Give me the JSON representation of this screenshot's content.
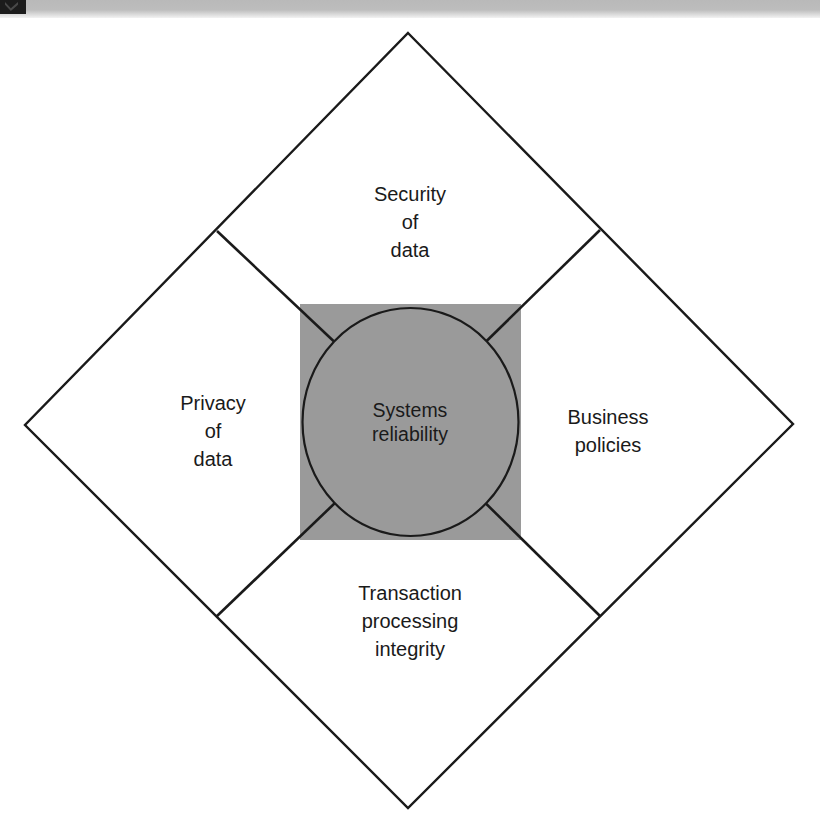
{
  "figure": {
    "center": {
      "line1": "Systems",
      "line2": "reliability"
    },
    "quadrants": {
      "top": {
        "line1": "Security",
        "line2": "of",
        "line3": "data"
      },
      "left": {
        "line1": "Privacy",
        "line2": "of",
        "line3": "data"
      },
      "right": {
        "line1": "Business",
        "line2": "policies",
        "line3": ""
      },
      "bottom": {
        "line1": "Transaction",
        "line2": "processing",
        "line3": "integrity"
      }
    },
    "colors": {
      "stroke": "#1a1a1a",
      "center_fill": "#9a9a9a",
      "background": "#ffffff",
      "scan_band": "#bdbdbd",
      "scan_corner": "#1c1c1c"
    }
  }
}
